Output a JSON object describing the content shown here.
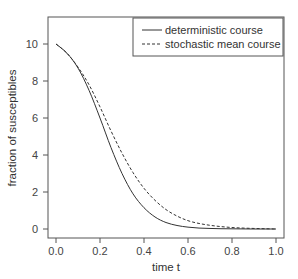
{
  "chart_data": {
    "type": "line",
    "title": "",
    "xlabel": "time t",
    "ylabel": "fraction of susceptibles",
    "xlim": [
      0.0,
      1.0
    ],
    "ylim": [
      0,
      10
    ],
    "xticks": [
      "0.0",
      "0.2",
      "0.4",
      "0.6",
      "0.8",
      "1.0"
    ],
    "yticks": [
      "0",
      "2",
      "4",
      "6",
      "8",
      "10"
    ],
    "grid": false,
    "legend_position": "upper right",
    "x": [
      0.0,
      0.05,
      0.1,
      0.15,
      0.2,
      0.25,
      0.3,
      0.35,
      0.4,
      0.45,
      0.5,
      0.55,
      0.6,
      0.65,
      0.7,
      0.75,
      0.8,
      0.85,
      0.9,
      0.95,
      1.0
    ],
    "series": [
      {
        "name": "deterministic course",
        "style": "solid",
        "values": [
          10.0,
          9.5,
          8.7,
          7.5,
          6.0,
          4.4,
          3.0,
          1.9,
          1.15,
          0.65,
          0.35,
          0.19,
          0.1,
          0.05,
          0.03,
          0.015,
          0.01,
          0.005,
          0.0,
          0.0,
          0.0
        ]
      },
      {
        "name": "stochastic mean course",
        "style": "dashed",
        "values": [
          10.0,
          9.5,
          8.75,
          7.8,
          6.6,
          5.3,
          4.1,
          3.05,
          2.2,
          1.55,
          1.05,
          0.7,
          0.45,
          0.3,
          0.2,
          0.13,
          0.08,
          0.05,
          0.03,
          0.015,
          0.0
        ]
      }
    ]
  }
}
